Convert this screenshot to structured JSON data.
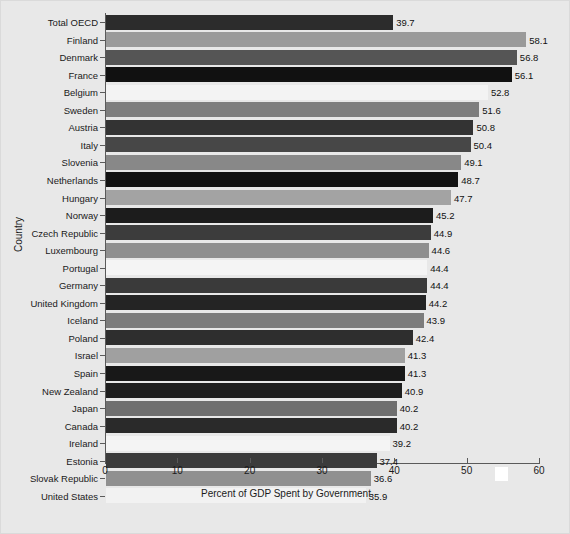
{
  "chart_data": {
    "type": "bar",
    "orientation": "horizontal",
    "title": "",
    "xlabel": "Percent of GDP Spent by Government",
    "ylabel": "Country",
    "xlim": [
      0,
      60
    ],
    "xticks": [
      0,
      10,
      20,
      30,
      40,
      50,
      60
    ],
    "grid": false,
    "legend": null,
    "categories": [
      "Total OECD",
      "Finland",
      "Denmark",
      "France",
      "Belgium",
      "Sweden",
      "Austria",
      "Italy",
      "Slovenia",
      "Netherlands",
      "Hungary",
      "Norway",
      "Czech Republic",
      "Luxembourg",
      "Portugal",
      "Germany",
      "United Kingdom",
      "Iceland",
      "Poland",
      "Israel",
      "Spain",
      "New Zealand",
      "Japan",
      "Canada",
      "Ireland",
      "Estonia",
      "Slovak Republic",
      "United States"
    ],
    "values": [
      39.7,
      58.1,
      56.8,
      56.1,
      52.8,
      51.6,
      50.8,
      50.4,
      49.1,
      48.7,
      47.7,
      45.2,
      44.9,
      44.6,
      44.4,
      44.4,
      44.2,
      43.9,
      42.4,
      41.3,
      41.3,
      40.9,
      40.2,
      40.2,
      39.2,
      37.4,
      36.6,
      35.9
    ],
    "bar_colors": [
      "#2c2c2c",
      "#9a9a9a",
      "#555555",
      "#111111",
      "#f3f3f3",
      "#7e7e7e",
      "#333333",
      "#474747",
      "#888888",
      "#131313",
      "#a3a3a3",
      "#1c1c1c",
      "#3c3c3c",
      "#8f8f8f",
      "#f4f4f4",
      "#3a3a3a",
      "#242424",
      "#7c7c7c",
      "#2e2e2e",
      "#a0a0a0",
      "#181818",
      "#1e1e1e",
      "#6f6f6f",
      "#2a2a2a",
      "#f4f4f4",
      "#3b3b3b",
      "#909090",
      "#f2f2f2"
    ],
    "value_label_position": "outside-right",
    "background_color": "#e8e8e8",
    "axis_color": "#5a5a5a"
  },
  "artifacts": {
    "white_block_note": "white rectangle between 50 and 60 tick labels"
  }
}
